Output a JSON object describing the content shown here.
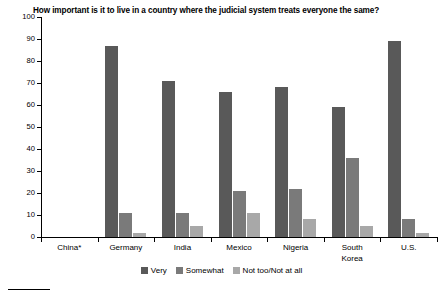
{
  "chart_data": {
    "type": "bar",
    "title": "How important is it to live in a country where the judicial system treats everyone the same?",
    "xlabel": "",
    "ylabel": "",
    "ylim": [
      0,
      100
    ],
    "ytick_step": 10,
    "yticks": [
      100,
      90,
      80,
      70,
      60,
      50,
      40,
      30,
      20,
      10,
      0
    ],
    "grid": false,
    "legend_position": "bottom",
    "categories": [
      "China*",
      "Germany",
      "India",
      "Mexico",
      "Nigeria",
      "South\nKorea",
      "U.S."
    ],
    "category_labels": [
      "China*",
      "Germany",
      "India",
      "Mexico",
      "Nigeria",
      "South Korea",
      "U.S."
    ],
    "series": [
      {
        "name": "Very",
        "color": "#595959",
        "values": [
          null,
          87,
          71,
          66,
          68,
          59,
          89
        ]
      },
      {
        "name": "Somewhat",
        "color": "#7a7a7a",
        "values": [
          null,
          11,
          11,
          21,
          22,
          36,
          8
        ]
      },
      {
        "name": "Not too/Not at all",
        "color": "#a8a8a8",
        "values": [
          null,
          2,
          5,
          11,
          8,
          5,
          2
        ]
      }
    ]
  },
  "legend": {
    "items": [
      {
        "label": "Very",
        "color": "#595959"
      },
      {
        "label": "Somewhat",
        "color": "#7a7a7a"
      },
      {
        "label": "Not too/Not at all",
        "color": "#a8a8a8"
      }
    ]
  },
  "colors": {
    "axis": "#000000",
    "background": "#ffffff",
    "very": "#595959",
    "somewhat": "#7a7a7a",
    "not_too": "#a8a8a8"
  }
}
